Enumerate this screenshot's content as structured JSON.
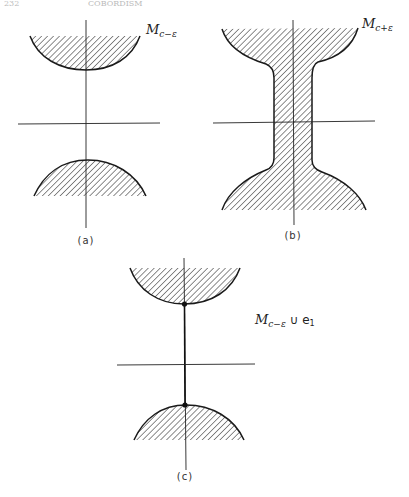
{
  "header": {
    "page_number": "232",
    "running_title": "COBORDISM"
  },
  "panels": [
    {
      "id": "a",
      "caption": "(a)",
      "label": {
        "base": "M",
        "sub": "c−ε",
        "suffix": ""
      }
    },
    {
      "id": "b",
      "caption": "(b)",
      "label": {
        "base": "M",
        "sub": "c+ε",
        "suffix": ""
      }
    },
    {
      "id": "c",
      "caption": "(c)",
      "label": {
        "base": "M",
        "sub": "c−ε",
        "suffix": " ∪ e",
        "suffix_sub": "1"
      }
    }
  ],
  "style": {
    "ink_color": "#1a1a1a",
    "background": "#ffffff",
    "hatch": "diagonal"
  }
}
